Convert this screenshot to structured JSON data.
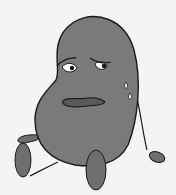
{
  "illustration": {
    "subject": "sad-bean-character",
    "description": "Grey kidney-bean-shaped cartoon character sitting with worried face and sweat drops",
    "colors": {
      "background": "#f4f4f4",
      "body": "#7a7a7a",
      "outline": "#1a1a1a",
      "limb": "#6e6e6e",
      "eye_white": "#ffffff",
      "mouth": "#5a5a5a"
    }
  }
}
